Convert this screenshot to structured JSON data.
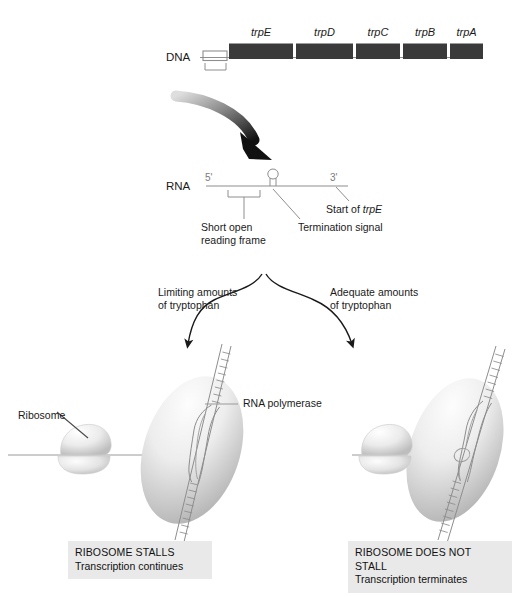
{
  "figure": {
    "colors": {
      "gene_box": "#3a3a3a",
      "line": "#8e8e8e",
      "caption_bg": "#e9e9e9",
      "arrow_black": "#1a1a1a",
      "ellipse_light": "#f2f2f2",
      "ellipse_dark": "#b8b8b8",
      "ribosome_light": "#fbfbfb",
      "ribosome_dark": "#c9c9c9",
      "text": "#1a1a1a",
      "prime_text": "#7b7b7b"
    }
  },
  "dna": {
    "row_label": "DNA",
    "genes": [
      {
        "name": "trpE"
      },
      {
        "name": "trpD"
      },
      {
        "name": "trpC"
      },
      {
        "name": "trpB"
      },
      {
        "name": "trpA"
      }
    ]
  },
  "rna": {
    "row_label": "RNA",
    "five_prime": "5'",
    "three_prime": "3'",
    "annotations": {
      "short_orf": "Short open\nreading frame",
      "termination_signal": "Termination signal",
      "start_of_trpe": "Start of trpE",
      "start_of_trpe_prefix": "Start of ",
      "start_of_trpe_gene": "trpE"
    }
  },
  "branches": {
    "left": "Limiting amounts\nof tryptophan",
    "right": "Adequate amounts\nof tryptophan"
  },
  "panel_labels": {
    "ribosome": "Ribosome",
    "rna_polymerase": "RNA polymerase"
  },
  "captions": {
    "left": {
      "title": "RIBOSOME STALLS",
      "subtitle": "Transcription continues"
    },
    "right": {
      "title": "RIBOSOME DOES NOT STALL",
      "subtitle": "Transcription terminates"
    }
  }
}
